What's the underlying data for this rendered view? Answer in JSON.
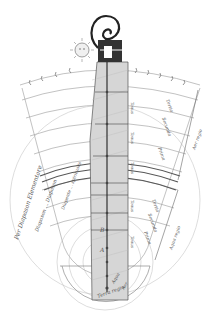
{
  "figure": {
    "colors": {
      "background": "#ffffff",
      "ink": "#333333",
      "light_ink": "#888888",
      "shaded_neck": "#c8c8c8"
    },
    "labels": {
      "left_arc_outer": "Per Diapason Elementare",
      "left_arc_inner": "Diapason ... Diapason",
      "left_inner_string": "Diapente ... spiritualis",
      "bottom_terra": "Terra regio",
      "bottom_aqua": "Aqua",
      "bottom_aer": "Aer",
      "right_bottom": "Aqua regio",
      "right_top": "Aer regio",
      "tonus_1": "Tonus",
      "tonus_2": "Tonus",
      "tonus_3": "Tonus",
      "tonus_4": "Tonus",
      "tonus_5": "Tonus",
      "right_1": "Tertia",
      "right_2": "Secunda",
      "right_3": "Prima",
      "right_4": "Tertia",
      "right_5": "Secunda",
      "right_6": "Prima",
      "letter_a": "A",
      "letter_b": "B"
    }
  }
}
